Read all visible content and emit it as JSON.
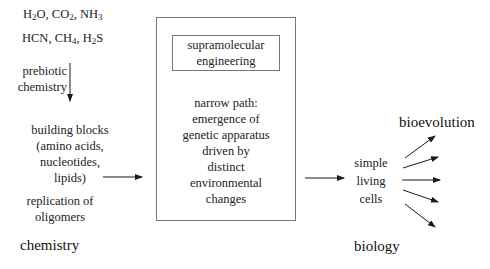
{
  "molecules": {
    "line1": [
      {
        "base": "H",
        "sub": "2"
      },
      {
        "base": "O, CO",
        "sub": "2"
      },
      {
        "base": ", NH",
        "sub": "3"
      }
    ],
    "line2": [
      {
        "base": "HCN, CH",
        "sub": "4"
      },
      {
        "base": ", H",
        "sub": "2"
      },
      {
        "base": "S",
        "sub": ""
      }
    ]
  },
  "left_column": {
    "prebiotic_label_1": "prebiotic",
    "prebiotic_label_2": "chemistry",
    "building_blocks": [
      "building blocks",
      "(amino acids,",
      "nucleotides,",
      "lipids)"
    ],
    "replication": [
      "replication of",
      "oligomers"
    ],
    "section_label": "chemistry"
  },
  "center_box": {
    "inner_box": [
      "supramolecular",
      "engineering"
    ],
    "narrow_path": [
      "narrow path:",
      "emergence of",
      "genetic apparatus",
      "driven by",
      "distinct",
      "environmental",
      "changes"
    ]
  },
  "right_column": {
    "cells": [
      "simple",
      "living",
      "cells"
    ],
    "evolution_label": "bioevolution",
    "section_label": "biology"
  },
  "colors": {
    "text": "#222222",
    "box_border": "#777777",
    "arrow": "#1a1a1a",
    "background": "#ffffff"
  }
}
